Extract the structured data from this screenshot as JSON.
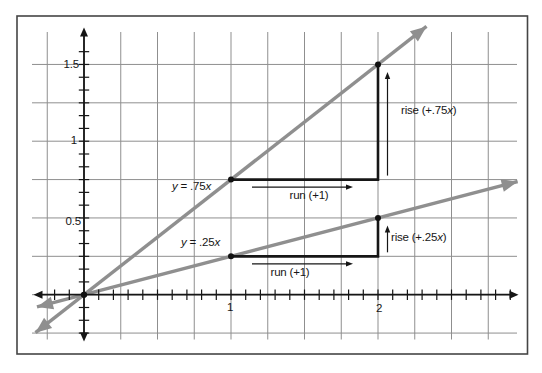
{
  "figure": {
    "background": "#ffffff",
    "border_color": "#454545"
  },
  "chart_data": {
    "type": "line",
    "title": "",
    "xlabel": "",
    "ylabel": "",
    "axes": {
      "x": {
        "range": [
          -0.33,
          2.95
        ],
        "tick_step": 0.1,
        "labeled_ticks": [
          {
            "value": 1,
            "label": "1"
          },
          {
            "value": 2,
            "label": "2"
          }
        ]
      },
      "y": {
        "range": [
          -0.3,
          1.74
        ],
        "tick_step": 0.08333,
        "labeled_ticks": [
          {
            "value": 0.5,
            "label": "0.5"
          },
          {
            "value": 1,
            "label": "1"
          },
          {
            "value": 1.5,
            "label": "1.5"
          }
        ]
      }
    },
    "grid": {
      "on": true,
      "step": 0.25
    },
    "series": [
      {
        "name": "y075",
        "equation": "y = .75x",
        "slope": 0.75,
        "intercept": 0,
        "x_draw_range": [
          -0.33,
          2.33
        ],
        "marked_points": [
          [
            0,
            0
          ],
          [
            1,
            0.75
          ],
          [
            2,
            1.5
          ]
        ],
        "color": "#8f8f8f"
      },
      {
        "name": "y025",
        "equation": "y = .25x",
        "slope": 0.25,
        "intercept": 0,
        "x_draw_range": [
          -0.32,
          2.95
        ],
        "marked_points": [
          [
            0,
            0
          ],
          [
            1,
            0.25
          ],
          [
            2,
            0.5
          ]
        ],
        "color": "#8f8f8f"
      }
    ],
    "slope_annotations": [
      {
        "start": [
          1,
          0.75
        ],
        "corner": [
          2,
          0.75
        ],
        "end": [
          2,
          1.5
        ],
        "run_label": "run (+1)",
        "rise_label": "rise (+.75x)"
      },
      {
        "start": [
          1,
          0.25
        ],
        "corner": [
          2,
          0.25
        ],
        "end": [
          2,
          0.5
        ],
        "run_label": "run (+1)",
        "rise_label": "rise (+.25x)"
      }
    ],
    "colors": {
      "axis": "#161616",
      "grid": "#8f8f8f",
      "line": "#8f8f8f",
      "annotation": "#161616",
      "point": "#111111"
    }
  }
}
